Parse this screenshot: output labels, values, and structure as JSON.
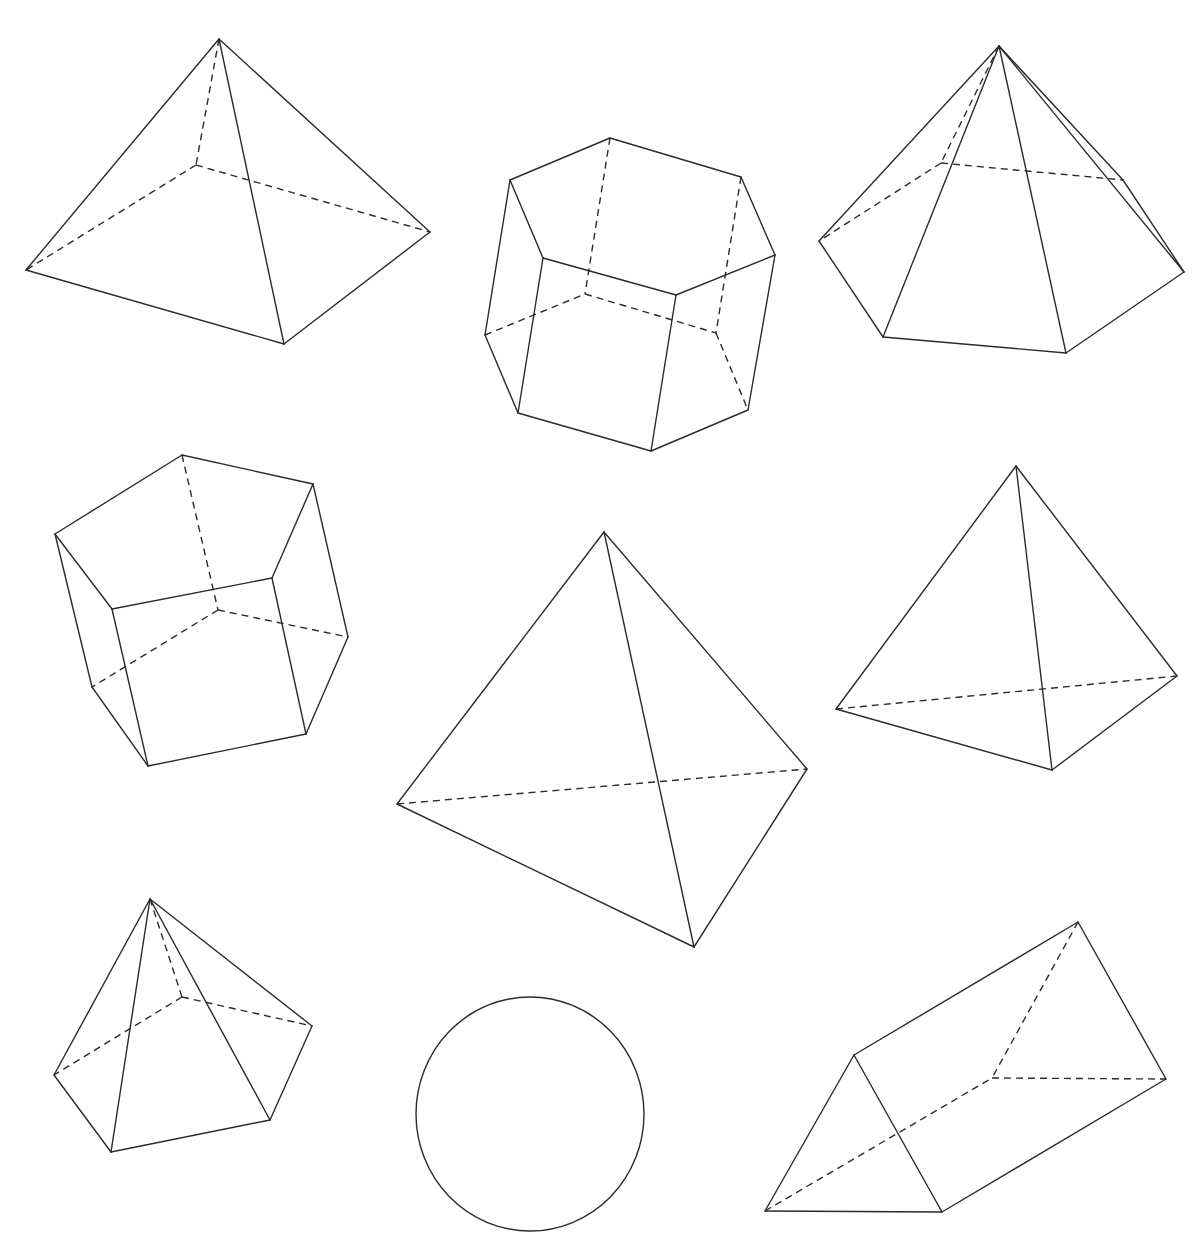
{
  "figure": {
    "stroke_color": "#2b2b2b",
    "background": "#ffffff",
    "shapes": [
      {
        "id": "square-pyramid",
        "label": "square pyramid",
        "vertices": {
          "apex": [
            219,
            39
          ],
          "left": [
            26,
            270
          ],
          "front": [
            284,
            344
          ],
          "right": [
            430,
            232
          ],
          "back": [
            196,
            165
          ]
        },
        "visible_edges": [
          [
            "apex",
            "left"
          ],
          [
            "apex",
            "front"
          ],
          [
            "apex",
            "right"
          ],
          [
            "left",
            "front"
          ],
          [
            "front",
            "right"
          ]
        ],
        "hidden_edges": [
          [
            "apex",
            "back"
          ],
          [
            "back",
            "left"
          ],
          [
            "back",
            "right"
          ]
        ]
      },
      {
        "id": "hexagonal-prism",
        "label": "hexagonal prism",
        "vertices": {
          "t1": [
            610,
            138
          ],
          "t2": [
            741,
            177
          ],
          "t3": [
            775,
            255
          ],
          "t4": [
            676,
            295
          ],
          "t5": [
            543,
            258
          ],
          "t6": [
            510,
            180
          ],
          "b1": [
            585,
            294
          ],
          "b2": [
            716,
            333
          ],
          "b3": [
            748,
            410
          ],
          "b4": [
            651,
            451
          ],
          "b5": [
            518,
            413
          ],
          "b6": [
            485,
            335
          ]
        },
        "visible_edges": [
          [
            "t1",
            "t2"
          ],
          [
            "t2",
            "t3"
          ],
          [
            "t3",
            "t4"
          ],
          [
            "t4",
            "t5"
          ],
          [
            "t5",
            "t6"
          ],
          [
            "t6",
            "t1"
          ],
          [
            "t3",
            "b3"
          ],
          [
            "t4",
            "b4"
          ],
          [
            "t5",
            "b5"
          ],
          [
            "t6",
            "b6"
          ],
          [
            "b3",
            "b4"
          ],
          [
            "b4",
            "b5"
          ],
          [
            "b5",
            "b6"
          ]
        ],
        "hidden_edges": [
          [
            "t1",
            "b1"
          ],
          [
            "t2",
            "b2"
          ],
          [
            "b6",
            "b1"
          ],
          [
            "b1",
            "b2"
          ],
          [
            "b2",
            "b3"
          ]
        ]
      },
      {
        "id": "pentagonal-pyramid-large",
        "label": "pentagonal pyramid",
        "vertices": {
          "apex": [
            999,
            46
          ],
          "left": [
            819,
            241
          ],
          "frontLeft": [
            883,
            337
          ],
          "frontRight": [
            1066,
            353
          ],
          "right": [
            1184,
            272
          ],
          "backRight": [
            1123,
            180
          ],
          "back": [
            941,
            163
          ]
        },
        "visible_edges": [
          [
            "apex",
            "left"
          ],
          [
            "apex",
            "frontLeft"
          ],
          [
            "apex",
            "frontRight"
          ],
          [
            "apex",
            "right"
          ],
          [
            "apex",
            "backRight"
          ],
          [
            "left",
            "frontLeft"
          ],
          [
            "frontLeft",
            "frontRight"
          ],
          [
            "frontRight",
            "right"
          ],
          [
            "right",
            "backRight"
          ]
        ],
        "hidden_edges": [
          [
            "apex",
            "back"
          ],
          [
            "back",
            "left"
          ],
          [
            "back",
            "backRight"
          ]
        ]
      },
      {
        "id": "pentagonal-prism",
        "label": "pentagonal prism",
        "vertices": {
          "t1": [
            182,
            455
          ],
          "t2": [
            313,
            484
          ],
          "t3": [
            272,
            578
          ],
          "t4": [
            112,
            609
          ],
          "t5": [
            55,
            534
          ],
          "b1": [
            218,
            610
          ],
          "b2": [
            348,
            637
          ],
          "b3": [
            306,
            734
          ],
          "b4": [
            148,
            766
          ],
          "b5": [
            92,
            687
          ]
        },
        "visible_edges": [
          [
            "t1",
            "t2"
          ],
          [
            "t2",
            "t3"
          ],
          [
            "t3",
            "t4"
          ],
          [
            "t4",
            "t5"
          ],
          [
            "t5",
            "t1"
          ],
          [
            "t2",
            "b2"
          ],
          [
            "t3",
            "b3"
          ],
          [
            "t4",
            "b4"
          ],
          [
            "t5",
            "b5"
          ],
          [
            "b2",
            "b3"
          ],
          [
            "b3",
            "b4"
          ],
          [
            "b4",
            "b5"
          ]
        ],
        "hidden_edges": [
          [
            "t1",
            "b1"
          ],
          [
            "b1",
            "b2"
          ],
          [
            "b1",
            "b5"
          ]
        ]
      },
      {
        "id": "tetrahedron-large",
        "label": "triangular pyramid",
        "vertices": {
          "apex": [
            604,
            532
          ],
          "left": [
            397,
            804
          ],
          "bottom": [
            694,
            947
          ],
          "right": [
            807,
            769
          ]
        },
        "visible_edges": [
          [
            "apex",
            "left"
          ],
          [
            "apex",
            "bottom"
          ],
          [
            "apex",
            "right"
          ],
          [
            "left",
            "bottom"
          ],
          [
            "bottom",
            "right"
          ]
        ],
        "hidden_edges": [
          [
            "left",
            "right"
          ]
        ]
      },
      {
        "id": "tetrahedron-right",
        "label": "triangular pyramid",
        "vertices": {
          "apex": [
            1016,
            466
          ],
          "left": [
            836,
            709
          ],
          "bottom": [
            1052,
            770
          ],
          "right": [
            1177,
            676
          ]
        },
        "visible_edges": [
          [
            "apex",
            "left"
          ],
          [
            "apex",
            "bottom"
          ],
          [
            "apex",
            "right"
          ],
          [
            "left",
            "bottom"
          ],
          [
            "bottom",
            "right"
          ]
        ],
        "hidden_edges": [
          [
            "left",
            "right"
          ]
        ]
      },
      {
        "id": "pentagonal-pyramid-small",
        "label": "pentagonal pyramid",
        "vertices": {
          "apex": [
            150,
            899
          ],
          "left": [
            54,
            1075
          ],
          "frontLeft": [
            111,
            1152
          ],
          "frontRight": [
            270,
            1120
          ],
          "right": [
            312,
            1026
          ],
          "back": [
            182,
            997
          ]
        },
        "visible_edges": [
          [
            "apex",
            "left"
          ],
          [
            "apex",
            "frontLeft"
          ],
          [
            "apex",
            "frontRight"
          ],
          [
            "apex",
            "right"
          ],
          [
            "left",
            "frontLeft"
          ],
          [
            "frontLeft",
            "frontRight"
          ],
          [
            "frontRight",
            "right"
          ]
        ],
        "hidden_edges": [
          [
            "apex",
            "back"
          ],
          [
            "back",
            "left"
          ],
          [
            "back",
            "right"
          ]
        ]
      },
      {
        "id": "sphere",
        "label": "circle / sphere",
        "circle": {
          "cx": 530,
          "cy": 1114,
          "rx": 114,
          "ry": 117
        }
      },
      {
        "id": "triangular-prism",
        "label": "triangular prism",
        "vertices": {
          "ft": [
            854,
            1055
          ],
          "fl": [
            765,
            1211
          ],
          "fr": [
            942,
            1212
          ],
          "bt": [
            1078,
            922
          ],
          "bl": [
            992,
            1078
          ],
          "br": [
            1166,
            1079
          ]
        },
        "visible_edges": [
          [
            "ft",
            "fl"
          ],
          [
            "fl",
            "fr"
          ],
          [
            "fr",
            "ft"
          ],
          [
            "ft",
            "bt"
          ],
          [
            "bt",
            "br"
          ],
          [
            "fr",
            "br"
          ]
        ],
        "hidden_edges": [
          [
            "bt",
            "bl"
          ],
          [
            "bl",
            "br"
          ],
          [
            "fl",
            "bl"
          ]
        ]
      }
    ]
  }
}
